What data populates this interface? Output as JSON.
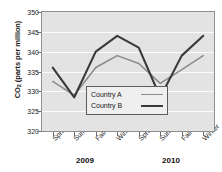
{
  "chart_data": {
    "type": "line",
    "title": "",
    "xlabel": "",
    "ylabel": "CO2 (parts per million)",
    "ylabel_main": "CO",
    "ylabel_sub": "2",
    "ylabel_rest": " (parts per million)",
    "ylim": [
      320,
      350
    ],
    "ytick_step": 5,
    "yticks": [
      320,
      325,
      330,
      335,
      340,
      345,
      350
    ],
    "grid": true,
    "legend_position": "center",
    "categories": [
      "Spring",
      "Summer",
      "Fall",
      "Winter",
      "Spring",
      "Summer",
      "Fall",
      "Winter"
    ],
    "groups": [
      {
        "label": "2009",
        "categories": [
          "Spring",
          "Summer",
          "Fall",
          "Winter"
        ]
      },
      {
        "label": "2010",
        "categories": [
          "Spring",
          "Summer",
          "Fall",
          "Winter"
        ]
      }
    ],
    "series": [
      {
        "name": "Country A",
        "color": "#8a8a8a",
        "values": [
          332.5,
          329,
          336,
          339,
          337,
          332,
          335.5,
          339
        ]
      },
      {
        "name": "Country B",
        "color": "#3a3a3a",
        "values": [
          336,
          328.5,
          340,
          344,
          341,
          328.5,
          339,
          344
        ]
      }
    ]
  },
  "legend": {
    "items": [
      {
        "label": "Country A"
      },
      {
        "label": "Country B"
      }
    ]
  }
}
